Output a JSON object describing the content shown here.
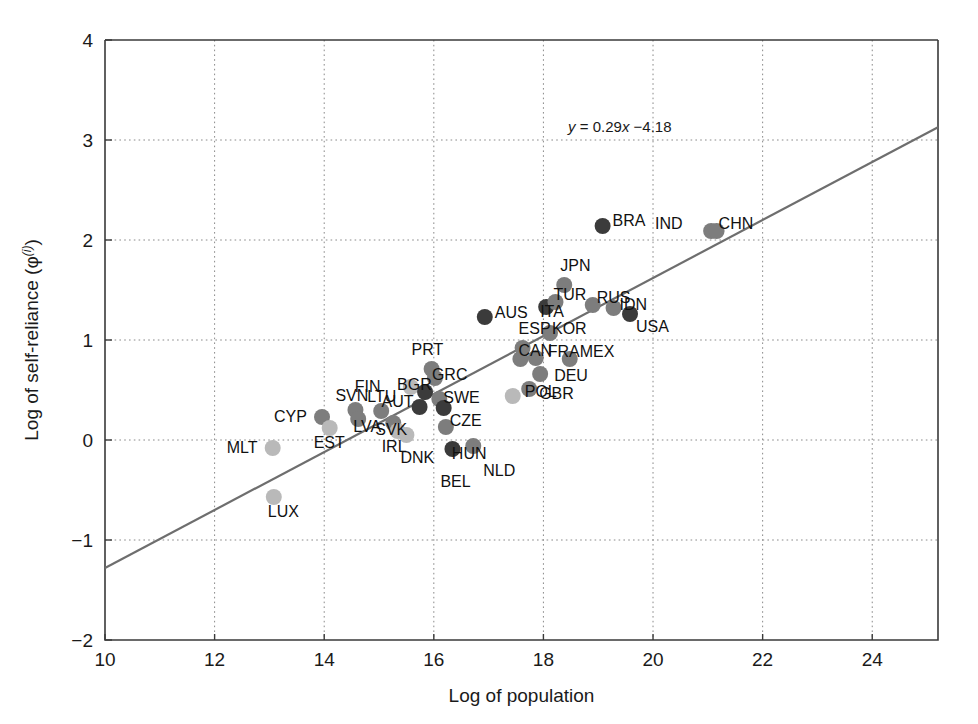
{
  "chart_data": {
    "type": "scatter",
    "title": "",
    "xlabel": "Log of population",
    "ylabel": "Log of self-reliance (φ⁽ⁱ⁾)",
    "ylabel_base": "Log of self-reliance (",
    "ylabel_symbol": "φ",
    "ylabel_superscript": "(i)",
    "ylabel_close": ")",
    "xlim": [
      10,
      25.2
    ],
    "ylim": [
      -2,
      4
    ],
    "xticks": [
      10,
      12,
      14,
      16,
      18,
      20,
      22,
      24
    ],
    "yticks": [
      -2,
      -1,
      0,
      1,
      2,
      3,
      4
    ],
    "xtick_labels": [
      "10",
      "12",
      "14",
      "16",
      "18",
      "20",
      "22",
      "24"
    ],
    "ytick_labels": [
      "−2",
      "−1",
      "0",
      "1",
      "2",
      "3",
      "4"
    ],
    "grid": true,
    "grid_style": "dotted",
    "legend": "none",
    "annotations": [
      {
        "name": "regression-equation",
        "text": "y = 0.29x −4.18",
        "lhs": "y",
        "eq": " = 0.29",
        "xvar": "x",
        "rhs": " −4.18",
        "x": 18.45,
        "y": 3.08
      }
    ],
    "fit_line": {
      "type": "linear",
      "slope": 0.29,
      "intercept": -4.18,
      "equation": "y = 0.29x − 4.18",
      "x_start": 10,
      "x_end": 25.2,
      "color": "#6e6e6e"
    },
    "point_colors": {
      "dark": "#3b3b3b",
      "mid": "#7d7d7d",
      "light": "#b9b9b9"
    },
    "points": [
      {
        "label": "MLT",
        "x": 13.06,
        "y": -0.08,
        "shade": "light",
        "lx": -46,
        "ly": 5
      },
      {
        "label": "LUX",
        "x": 13.08,
        "y": -0.57,
        "shade": "light",
        "lx": -6,
        "ly": 20
      },
      {
        "label": "CYP",
        "x": 13.96,
        "y": 0.23,
        "shade": "mid",
        "lx": -48,
        "ly": 5
      },
      {
        "label": "EST",
        "x": 14.1,
        "y": 0.12,
        "shade": "light",
        "lx": -16,
        "ly": 20
      },
      {
        "label": "SVN",
        "x": 14.57,
        "y": 0.3,
        "shade": "mid",
        "lx": -20,
        "ly": -9
      },
      {
        "label": "LVA",
        "x": 14.62,
        "y": 0.21,
        "shade": "mid",
        "lx": -5,
        "ly": 13
      },
      {
        "label": "LTU",
        "x": 15.04,
        "y": 0.29,
        "shade": "mid",
        "lx": -14,
        "ly": -9
      },
      {
        "label": "SVK",
        "x": 15.26,
        "y": 0.17,
        "shade": "mid",
        "lx": -18,
        "ly": 12
      },
      {
        "label": "IRL",
        "x": 15.34,
        "y": 0.09,
        "shade": "light",
        "lx": -16,
        "ly": 21
      },
      {
        "label": "DNK",
        "x": 15.5,
        "y": 0.05,
        "shade": "light",
        "lx": -6,
        "ly": 28
      },
      {
        "label": "FIN",
        "x": 15.58,
        "y": 0.53,
        "shade": "light",
        "lx": -56,
        "ly": 5
      },
      {
        "label": "AUT",
        "x": 15.74,
        "y": 0.33,
        "shade": "dark",
        "lx": -38,
        "ly": 0
      },
      {
        "label": "BGR",
        "x": 15.84,
        "y": 0.48,
        "shade": "dark",
        "lx": -28,
        "ly": -2
      },
      {
        "label": "PRT",
        "x": 15.96,
        "y": 0.71,
        "shade": "mid",
        "lx": -20,
        "ly": -14
      },
      {
        "label": "GRC",
        "x": 16.02,
        "y": 0.62,
        "shade": "mid",
        "lx": -3,
        "ly": 2
      },
      {
        "label": "SWE",
        "x": 16.1,
        "y": 0.41,
        "shade": "mid",
        "lx": 4,
        "ly": 4
      },
      {
        "label": "CZE",
        "x": 16.18,
        "y": 0.32,
        "shade": "dark",
        "lx": 6,
        "ly": 18
      },
      {
        "label": "HUN",
        "x": 16.22,
        "y": 0.13,
        "shade": "mid",
        "lx": 6,
        "ly": 32
      },
      {
        "label": "BEL",
        "x": 16.34,
        "y": -0.09,
        "shade": "dark",
        "lx": -12,
        "ly": 38
      },
      {
        "label": "NLD",
        "x": 16.72,
        "y": -0.06,
        "shade": "mid",
        "lx": 10,
        "ly": 30
      },
      {
        "label": "AUS",
        "x": 16.93,
        "y": 1.23,
        "shade": "dark",
        "lx": 10,
        "ly": 1
      },
      {
        "label": "POL",
        "x": 17.44,
        "y": 0.44,
        "shade": "light",
        "lx": 12,
        "ly": 1
      },
      {
        "label": "CAN",
        "x": 17.58,
        "y": 0.81,
        "shade": "mid",
        "lx": -2,
        "ly": -3
      },
      {
        "label": "ESP",
        "x": 17.62,
        "y": 0.92,
        "shade": "mid",
        "lx": -4,
        "ly": -14
      },
      {
        "label": "GBR",
        "x": 17.74,
        "y": 0.51,
        "shade": "mid",
        "lx": 10,
        "ly": 10
      },
      {
        "label": "FRA",
        "x": 17.86,
        "y": 0.82,
        "shade": "mid",
        "lx": 12,
        "ly": -1
      },
      {
        "label": "DEU",
        "x": 17.94,
        "y": 0.66,
        "shade": "mid",
        "lx": 14,
        "ly": 7
      },
      {
        "label": "ITA",
        "x": 18.05,
        "y": 1.33,
        "shade": "dark",
        "lx": -6,
        "ly": 10
      },
      {
        "label": "KOR",
        "x": 18.12,
        "y": 1.07,
        "shade": "mid",
        "lx": 2,
        "ly": 1
      },
      {
        "label": "TUR",
        "x": 18.22,
        "y": 1.38,
        "shade": "mid",
        "lx": -2,
        "ly": -2
      },
      {
        "label": "JPN",
        "x": 18.38,
        "y": 1.55,
        "shade": "mid",
        "lx": -4,
        "ly": -14
      },
      {
        "label": "MEX",
        "x": 18.48,
        "y": 0.81,
        "shade": "mid",
        "lx": 10,
        "ly": -2
      },
      {
        "label": "BRA",
        "x": 19.08,
        "y": 2.14,
        "shade": "dark",
        "lx": 10,
        "ly": 0
      },
      {
        "label": "RUS",
        "x": 18.9,
        "y": 1.35,
        "shade": "mid",
        "lx": 4,
        "ly": -2
      },
      {
        "label": "IDN",
        "x": 19.28,
        "y": 1.32,
        "shade": "mid",
        "lx": 6,
        "ly": 2
      },
      {
        "label": "USA",
        "x": 19.58,
        "y": 1.26,
        "shade": "dark",
        "lx": 6,
        "ly": 18
      },
      {
        "label": "IND",
        "x": 21.06,
        "y": 2.09,
        "shade": "mid",
        "lx": -56,
        "ly": -2
      },
      {
        "label": "CHN",
        "x": 21.16,
        "y": 2.09,
        "shade": "mid",
        "lx": 2,
        "ly": -2
      }
    ]
  },
  "geometry": {
    "plot_left": 105,
    "plot_right": 938,
    "plot_top": 40,
    "plot_bottom": 640
  }
}
